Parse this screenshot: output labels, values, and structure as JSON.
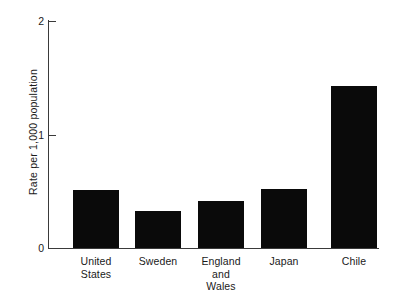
{
  "chart_data": {
    "type": "bar",
    "title": "",
    "subtitle": "",
    "xlabel": "",
    "ylabel": "Rate per 1,000 population",
    "categories": [
      "United States",
      "Sweden",
      "England and Wales",
      "Japan",
      "Chile"
    ],
    "category_label_lines": [
      [
        "United",
        "States"
      ],
      [
        "Sweden"
      ],
      [
        "England",
        "and",
        "Wales"
      ],
      [
        "Japan"
      ],
      [
        "Chile"
      ]
    ],
    "values": [
      0.51,
      0.33,
      0.41,
      0.52,
      1.43
    ],
    "ylim": [
      0,
      2
    ],
    "yticks": [
      0,
      1,
      2
    ],
    "ytick_labels": [
      "0",
      "1",
      "2"
    ],
    "grid": false,
    "legend": null,
    "legend_position": "none",
    "bar_color": "#0a0a0a",
    "axis_color": "#3a3a3a",
    "background_color": "#ffffff",
    "annotations": []
  },
  "geometry": {
    "plot_left": 48,
    "plot_right": 379,
    "y_zero": 248,
    "y_top": 21,
    "px_per_unit": 113.5,
    "bars": [
      {
        "x": 73,
        "width": 46
      },
      {
        "x": 135,
        "width": 46
      },
      {
        "x": 198,
        "width": 46
      },
      {
        "x": 261,
        "width": 46
      },
      {
        "x": 331,
        "width": 46
      }
    ],
    "label_centers": [
      96,
      158,
      221,
      284,
      354
    ]
  }
}
